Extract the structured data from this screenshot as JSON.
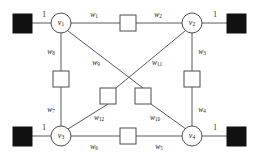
{
  "figure": {
    "type": "network-graph-diagram",
    "background_color": "#ffffff",
    "line_color": "#5a5a5a",
    "terminal_fill_color": "#111111",
    "node_fill_color": "#ffffff"
  },
  "nodes": [
    {
      "id": "v1",
      "base": "v",
      "sub": "1",
      "cx": 61,
      "cy": 23,
      "r": 10
    },
    {
      "id": "v2",
      "base": "v",
      "sub": "2",
      "cx": 192,
      "cy": 23,
      "r": 10
    },
    {
      "id": "v3",
      "base": "v",
      "sub": "3",
      "cx": 61,
      "cy": 136,
      "r": 10
    },
    {
      "id": "v4",
      "base": "v",
      "sub": "4",
      "cx": 192,
      "cy": 136,
      "r": 10
    }
  ],
  "terminals": [
    {
      "id": "terminal-top-left",
      "x": 13,
      "y": 14,
      "size": 19
    },
    {
      "id": "terminal-top-right",
      "x": 227,
      "y": 14,
      "size": 19
    },
    {
      "id": "terminal-bottom-left",
      "x": 13,
      "y": 127,
      "size": 19
    },
    {
      "id": "terminal-bottom-right",
      "x": 227,
      "y": 127,
      "size": 19
    }
  ],
  "terminal_edges": [
    {
      "id": "terminal-edge-top-left",
      "label": "1",
      "lx": 44,
      "ly": 15
    },
    {
      "id": "terminal-edge-top-right",
      "label": "1",
      "lx": 215,
      "ly": 15
    },
    {
      "id": "terminal-edge-bottom-left",
      "label": "1",
      "lx": 44,
      "ly": 128
    },
    {
      "id": "terminal-edge-bottom-right",
      "label": "1",
      "lx": 215,
      "ly": 128
    }
  ],
  "edge_boxes": [
    {
      "id": "box-top",
      "x": 120,
      "y": 15,
      "size": 16
    },
    {
      "id": "box-left",
      "x": 53,
      "y": 71,
      "size": 16
    },
    {
      "id": "box-right",
      "x": 184,
      "y": 71,
      "size": 16
    },
    {
      "id": "box-bottom",
      "x": 120,
      "y": 128,
      "size": 16
    },
    {
      "id": "box-diag-left",
      "x": 100,
      "y": 88,
      "size": 16
    },
    {
      "id": "box-diag-right",
      "x": 135,
      "y": 88,
      "size": 16
    }
  ],
  "edge_labels": [
    {
      "id": "w1",
      "base": "w",
      "sub": "1",
      "lx": 94,
      "ly": 15
    },
    {
      "id": "w2",
      "base": "w",
      "sub": "2",
      "lx": 158,
      "ly": 15
    },
    {
      "id": "w3",
      "base": "w",
      "sub": "3",
      "lx": 202,
      "ly": 52
    },
    {
      "id": "w4",
      "base": "w",
      "sub": "4",
      "lx": 202,
      "ly": 110
    },
    {
      "id": "w5",
      "base": "w",
      "sub": "5",
      "lx": 159,
      "ly": 147
    },
    {
      "id": "w6",
      "base": "w",
      "sub": "6",
      "lx": 94,
      "ly": 147
    },
    {
      "id": "w7",
      "base": "w",
      "sub": "7",
      "lx": 51,
      "ly": 110
    },
    {
      "id": "w8",
      "base": "w",
      "sub": "8",
      "lx": 51,
      "ly": 52
    },
    {
      "id": "w9",
      "base": "w",
      "sub": "9",
      "lx": 96,
      "ly": 63
    },
    {
      "id": "w10",
      "base": "w",
      "sub": "10",
      "lx": 155,
      "ly": 118
    },
    {
      "id": "w11",
      "base": "w",
      "sub": "11",
      "lx": 157,
      "ly": 63
    },
    {
      "id": "w12",
      "base": "w",
      "sub": "12",
      "lx": 99,
      "ly": 118
    }
  ],
  "edges": [
    {
      "id": "edge-terminal-v1",
      "x1": 32,
      "y1": 23,
      "x2": 51,
      "y2": 23
    },
    {
      "id": "edge-v1-boxtop",
      "x1": 71,
      "y1": 23,
      "x2": 120,
      "y2": 23
    },
    {
      "id": "edge-boxtop-v2",
      "x1": 136,
      "y1": 23,
      "x2": 182,
      "y2": 23
    },
    {
      "id": "edge-v2-terminal",
      "x1": 202,
      "y1": 23,
      "x2": 227,
      "y2": 23
    },
    {
      "id": "edge-terminal-v3",
      "x1": 32,
      "y1": 136,
      "x2": 51,
      "y2": 136
    },
    {
      "id": "edge-v3-boxbot",
      "x1": 71,
      "y1": 136,
      "x2": 120,
      "y2": 136
    },
    {
      "id": "edge-boxbot-v4",
      "x1": 136,
      "y1": 136,
      "x2": 182,
      "y2": 136
    },
    {
      "id": "edge-v4-terminal",
      "x1": 202,
      "y1": 136,
      "x2": 227,
      "y2": 136
    },
    {
      "id": "edge-v1-boxleft",
      "x1": 61,
      "y1": 33,
      "x2": 61,
      "y2": 71
    },
    {
      "id": "edge-boxleft-v3",
      "x1": 61,
      "y1": 87,
      "x2": 61,
      "y2": 126
    },
    {
      "id": "edge-v2-boxright",
      "x1": 192,
      "y1": 33,
      "x2": 192,
      "y2": 71
    },
    {
      "id": "edge-boxright-v4",
      "x1": 192,
      "y1": 87,
      "x2": 192,
      "y2": 126
    },
    {
      "id": "edge-v1-diagbox",
      "x1": 68,
      "y1": 31,
      "x2": 143,
      "y2": 88
    },
    {
      "id": "edge-diagbox-v4",
      "x1": 151,
      "y1": 104,
      "x2": 186,
      "y2": 129
    },
    {
      "id": "edge-v2-diagbox",
      "x1": 185,
      "y1": 31,
      "x2": 116,
      "y2": 88
    },
    {
      "id": "edge-diagbox-v3",
      "x1": 108,
      "y1": 104,
      "x2": 68,
      "y2": 129
    }
  ]
}
